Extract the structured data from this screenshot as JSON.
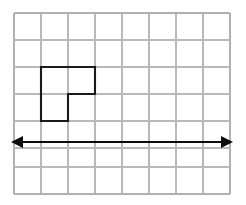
{
  "figure": {
    "title": "Grid with L-shaped polygon and horizontal double-headed arrow",
    "canvas": {
      "width": 246,
      "height": 205,
      "background": "#ffffff"
    },
    "grid": {
      "name": "square-grid",
      "origin_x": 14,
      "origin_y": 13,
      "cell_size": 27,
      "columns": 8,
      "rows": 7,
      "right_x": 230,
      "bottom_y": 194,
      "line_color": "#b9b9b9",
      "line_width": 1.2,
      "border_color": "#b0b0b0",
      "border_width": 1.6,
      "vertical_lines_x": [
        14,
        41,
        68,
        95,
        122,
        149,
        176,
        203,
        230
      ],
      "horizontal_lines_y": [
        13,
        40,
        67,
        94,
        121,
        148,
        167,
        194
      ]
    },
    "shape": {
      "name": "l-shaped-polygon",
      "label": "L-shape",
      "stroke_color": "#1a1a1a",
      "stroke_width": 2.1,
      "fill": "none",
      "cells_wide": 2,
      "cells_tall": 2,
      "missing_cell": "bottom-right",
      "points": "41,67 95,67 95,94 68,94 68,121 41,121",
      "bounds": {
        "left": 41,
        "top": 67,
        "right": 95,
        "bottom": 121
      }
    },
    "arrow": {
      "name": "horizontal-double-arrow",
      "label": "line of symmetry",
      "color": "#0d0d0d",
      "line_width": 2.2,
      "y": 142,
      "x_start": 11,
      "x_end": 233,
      "head_length": 12,
      "head_half_width": 6,
      "double_headed": true
    }
  }
}
